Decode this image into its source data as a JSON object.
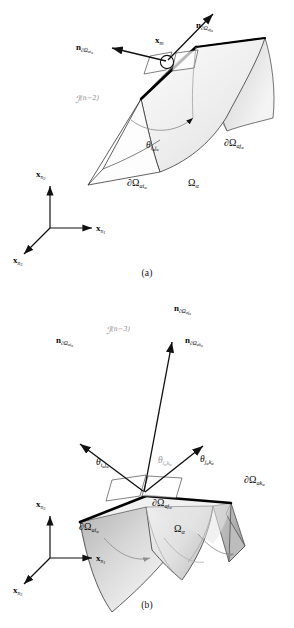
{
  "figure": {
    "type": "diagram"
  },
  "panel_a": {
    "caption": "(a)",
    "manifold_label": "ℐ",
    "manifold_sup": "(n−2)",
    "point_label": "x",
    "point_sub": "m",
    "normals": [
      {
        "name": "normal-ai",
        "symbol": "n",
        "sub_boundary": "∂Ω",
        "sub_indices": "ai",
        "sub_alpha": "α"
      },
      {
        "name": "normal-aj",
        "symbol": "n",
        "sub_boundary": "∂Ω",
        "sub_indices": "aj",
        "sub_alpha": "α"
      }
    ],
    "angles": [
      {
        "name": "theta-i-j",
        "symbol": "θ",
        "sub": "i",
        "sub_alpha": "α",
        "sub2": "j",
        "sub2_alpha": "α"
      }
    ],
    "boundaries": [
      {
        "name": "boundary-ai",
        "symbol": "∂Ω",
        "indices": "ai",
        "alpha": "α"
      },
      {
        "name": "boundary-aj",
        "symbol": "∂Ω",
        "indices": "aj",
        "alpha": "α"
      }
    ],
    "domain": {
      "symbol": "Ω",
      "sub": "α"
    },
    "axes": [
      {
        "name": "axis-x-n2",
        "symbol": "x",
        "sub": "n",
        "sub2": "2"
      },
      {
        "name": "axis-x-n1",
        "symbol": "x",
        "sub": "n",
        "sub2": "1"
      },
      {
        "name": "axis-x-n3",
        "symbol": "x",
        "sub": "n",
        "sub2": "3"
      }
    ]
  },
  "panel_b": {
    "caption": "(b)",
    "manifold_label": "ℐ",
    "manifold_sup": "(n−3)",
    "normals": [
      {
        "name": "normal-ai",
        "symbol": "n",
        "sub_boundary": "∂Ω",
        "sub_indices": "ai",
        "sub_alpha": "α"
      },
      {
        "name": "normal-aj",
        "symbol": "n",
        "sub_boundary": "∂Ω",
        "sub_indices": "aj",
        "sub_alpha": "α"
      },
      {
        "name": "normal-ak",
        "symbol": "n",
        "sub_boundary": "∂Ω",
        "sub_indices": "ak",
        "sub_alpha": "α"
      }
    ],
    "angles": [
      {
        "name": "theta-i-j",
        "symbol": "θ",
        "sub": "i",
        "sub_alpha": "α",
        "sub2": "j",
        "sub2_alpha": "α",
        "grey": false
      },
      {
        "name": "theta-i-k",
        "symbol": "θ",
        "sub": "i",
        "sub_alpha": "α",
        "sub2": "k",
        "sub2_alpha": "α",
        "grey": true
      },
      {
        "name": "theta-j-k",
        "symbol": "θ",
        "sub": "j",
        "sub_alpha": "α",
        "sub2": "k",
        "sub2_alpha": "α",
        "grey": false
      }
    ],
    "boundaries": [
      {
        "name": "boundary-ai",
        "symbol": "∂Ω",
        "indices": "ai",
        "alpha": "α"
      },
      {
        "name": "boundary-aj",
        "symbol": "∂Ω",
        "indices": "aj",
        "alpha": "α"
      },
      {
        "name": "boundary-ak",
        "symbol": "∂Ω",
        "indices": "ak",
        "alpha": "α"
      }
    ],
    "domain": {
      "symbol": "Ω",
      "sub": "α"
    },
    "axes": [
      {
        "name": "axis-x-n2",
        "symbol": "x",
        "sub": "n",
        "sub2": "2"
      },
      {
        "name": "axis-x-n1",
        "symbol": "x",
        "sub": "n",
        "sub2": "1"
      },
      {
        "name": "axis-x-n3",
        "symbol": "x",
        "sub": "n",
        "sub2": "3"
      }
    ]
  },
  "colors": {
    "line": "#111111",
    "grey_text": "#9a9a9a",
    "surface_light": "#f2f2f2",
    "surface_mid": "#cfcfcf",
    "surface_dark": "#9e9e9e",
    "edge_bold": "#000000"
  }
}
